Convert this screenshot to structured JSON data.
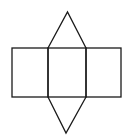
{
  "diagram": {
    "title": "",
    "stroke_color": "#1a1a1a",
    "background_color": "#ffffff",
    "faces": [
      {
        "id": "rect-left",
        "type": "rectangle"
      },
      {
        "id": "rect-middle",
        "type": "rectangle"
      },
      {
        "id": "rect-right",
        "type": "rectangle"
      },
      {
        "id": "triangle-top",
        "type": "triangle",
        "attached_to": "rect-middle",
        "side": "top"
      },
      {
        "id": "triangle-bottom",
        "type": "triangle",
        "attached_to": "rect-middle",
        "side": "bottom"
      }
    ]
  }
}
